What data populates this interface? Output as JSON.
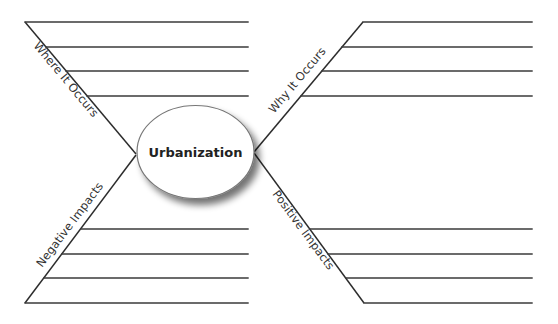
{
  "diagram": {
    "type": "spider-map",
    "center": {
      "label": "Urbanization",
      "shape": "ellipse",
      "fill": "#ffffff",
      "stroke": "#777777"
    },
    "branches": [
      {
        "id": "top-left",
        "label": "Where It Occurs",
        "writing_lines": 4
      },
      {
        "id": "top-right",
        "label": "Why It Occurs",
        "writing_lines": 4
      },
      {
        "id": "bottom-left",
        "label": "Negative Impacts",
        "writing_lines": 4
      },
      {
        "id": "bottom-right",
        "label": "Positive Impacts",
        "writing_lines": 4
      }
    ],
    "colors": {
      "line": "#3a3a3a",
      "text": "#333333",
      "background": "#ffffff"
    }
  }
}
